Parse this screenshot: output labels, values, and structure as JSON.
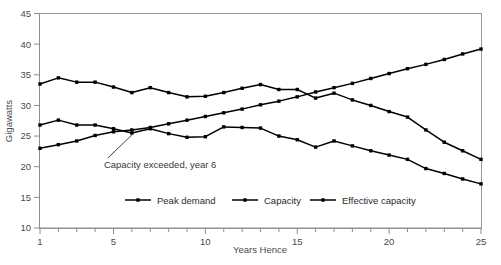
{
  "chart_data": {
    "type": "line",
    "title": "",
    "xlabel": "Years Hence",
    "ylabel": "Gigawatts",
    "xlim": [
      1,
      25
    ],
    "ylim": [
      10,
      45
    ],
    "grid": false,
    "legend_position": "inside-bottom-center",
    "y_ticks": [
      10,
      15,
      20,
      25,
      30,
      35,
      40,
      45
    ],
    "x_ticks_major": [
      1,
      5,
      10,
      15,
      20,
      25
    ],
    "x_minor_tick_step": 1,
    "x": [
      1,
      2,
      3,
      4,
      5,
      6,
      7,
      8,
      9,
      10,
      11,
      12,
      13,
      14,
      15,
      16,
      17,
      18,
      19,
      20,
      21,
      22,
      23,
      24,
      25
    ],
    "series": [
      {
        "name": "Peak demand",
        "marker": "square",
        "color": "#000000",
        "values": [
          23.0,
          23.6,
          24.2,
          25.1,
          25.7,
          26.0,
          26.4,
          27.0,
          27.6,
          28.2,
          28.8,
          29.4,
          30.1,
          30.7,
          31.4,
          32.2,
          32.9,
          33.6,
          34.4,
          35.2,
          36.0,
          36.7,
          37.5,
          38.4,
          39.2
        ]
      },
      {
        "name": "Capacity",
        "marker": "square",
        "color": "#000000",
        "values": [
          33.5,
          34.5,
          33.8,
          33.8,
          33.0,
          32.1,
          32.9,
          32.1,
          31.4,
          31.5,
          32.1,
          32.8,
          33.4,
          32.6,
          32.6,
          31.2,
          32.0,
          30.9,
          30.0,
          29.0,
          28.1,
          26.0,
          24.0,
          22.6,
          21.2
        ]
      },
      {
        "name": "Effective capacity",
        "marker": "square",
        "color": "#000000",
        "values": [
          26.8,
          27.6,
          26.8,
          26.8,
          26.2,
          25.5,
          26.2,
          25.4,
          24.8,
          24.9,
          26.5,
          26.4,
          26.3,
          25.0,
          24.4,
          23.2,
          24.2,
          23.4,
          22.6,
          21.9,
          21.2,
          19.7,
          18.9,
          18.0,
          17.2
        ]
      }
    ],
    "annotations": [
      {
        "text": "Capacity exceeded,  year 6",
        "target_x": 6,
        "target_y": 26.0
      }
    ]
  },
  "legend": {
    "entries": [
      {
        "label": "Peak demand"
      },
      {
        "label": "Capacity"
      },
      {
        "label": "Effective capacity"
      }
    ]
  },
  "axes": {
    "y_label": "Gigawatts",
    "x_label": "Years Hence",
    "y_tick_labels": [
      "10",
      "15",
      "20",
      "25",
      "30",
      "35",
      "40",
      "45"
    ],
    "x_tick_labels": [
      "1",
      "5",
      "10",
      "15",
      "20",
      "25"
    ]
  },
  "annotation": {
    "text": "Capacity exceeded,  year 6"
  }
}
